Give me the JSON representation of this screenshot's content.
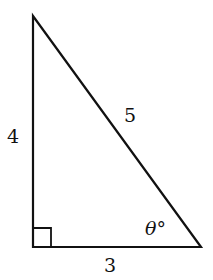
{
  "diagram": {
    "type": "right-triangle",
    "stroke_color": "#111111",
    "vertices": {
      "top": [
        33,
        16
      ],
      "right_angle": [
        33,
        247
      ],
      "bottom_right": [
        201,
        247
      ]
    },
    "labels": {
      "vertical_leg": "4",
      "hypotenuse": "5",
      "horizontal_leg": "3",
      "angle": "θ°"
    },
    "right_angle_marker": true
  }
}
